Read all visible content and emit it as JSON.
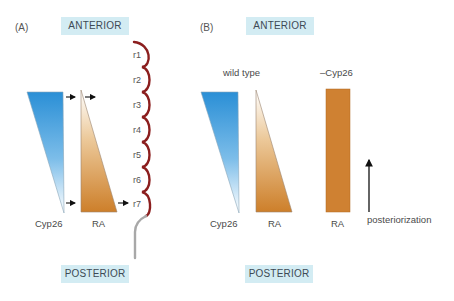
{
  "panel_a": {
    "label": "(A)",
    "anterior": "ANTERIOR",
    "posterior": "POSTERIOR",
    "cyp26_label": "Cyp26",
    "ra_label": "RA",
    "rhombomeres": [
      "r1",
      "r2",
      "r3",
      "r4",
      "r5",
      "r6",
      "r7"
    ]
  },
  "panel_b": {
    "label": "(B)",
    "anterior": "ANTERIOR",
    "posterior": "POSTERIOR",
    "wild_type_label": "wild type",
    "knockout_label": "–Cyp26",
    "cyp26_label": "Cyp26",
    "ra_label": "RA",
    "ra_knockout_label": "RA",
    "arrow_label": "posteriorization"
  },
  "colors": {
    "cyp26_top": "#2a8fd6",
    "cyp26_bottom": "#ffffff",
    "ra_top": "#ffffff",
    "ra_bottom": "#cd7f2a",
    "ra_solid": "#cf8132",
    "hindbrain": "#8b1e1e",
    "spinal_cord": "#a8a8a8",
    "axis_box": "#d3ecf3"
  }
}
